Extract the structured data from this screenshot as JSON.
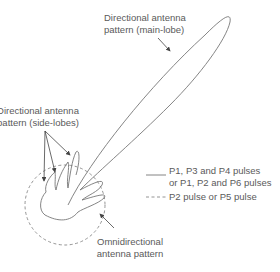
{
  "labels": {
    "main_lobe": [
      "Directional antenna",
      "pattern (main-lobe)"
    ],
    "side_lobes": [
      "Directional antenna",
      "pattern (side-lobes)"
    ],
    "omni": [
      "Omnidirectional",
      "antenna pattern"
    ]
  },
  "legend": {
    "solid_line": [
      "P1, P3 and P4 pulses",
      "or P1, P2 and P6 pulses"
    ],
    "dashed_line": "P2 pulse or P5 pulse"
  },
  "colors": {
    "line": "#777777",
    "text": "#5a5a5a",
    "background": "#ffffff"
  }
}
